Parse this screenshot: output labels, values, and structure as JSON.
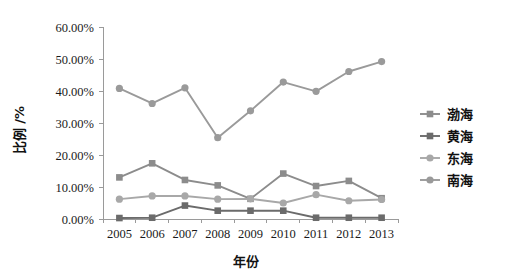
{
  "chart_data": {
    "type": "line",
    "title": "",
    "xlabel": "年份",
    "ylabel": "比例 /%",
    "categories": [
      "2005",
      "2006",
      "2007",
      "2008",
      "2009",
      "2010",
      "2011",
      "2012",
      "2013"
    ],
    "ylim": [
      0,
      60
    ],
    "ytick_labels": [
      "0.00%",
      "10.00%",
      "20.00%",
      "30.00%",
      "40.00%",
      "50.00%",
      "60.00%"
    ],
    "ytick_values": [
      0,
      10,
      20,
      30,
      40,
      50,
      60
    ],
    "grid": false,
    "legend_position": "right",
    "series": [
      {
        "name": "渤海",
        "marker": "square",
        "color": "#8c8c8c",
        "values": [
          13.0,
          17.4,
          12.2,
          10.5,
          6.3,
          14.2,
          10.3,
          11.9,
          6.5
        ]
      },
      {
        "name": "黄海",
        "marker": "square",
        "color": "#6b6b6b",
        "values": [
          0.3,
          0.4,
          4.2,
          2.6,
          2.6,
          2.6,
          0.4,
          0.4,
          0.4
        ]
      },
      {
        "name": "东海",
        "marker": "circle",
        "color": "#a8a8a8",
        "values": [
          6.2,
          7.2,
          7.2,
          6.2,
          6.3,
          5.0,
          7.6,
          5.7,
          6.1
        ]
      },
      {
        "name": "南海",
        "marker": "circle",
        "color": "#9a9a9a",
        "values": [
          40.8,
          36.1,
          41.0,
          25.4,
          33.8,
          42.8,
          39.9,
          46.1,
          49.2
        ]
      }
    ]
  },
  "legend": {
    "items": [
      {
        "label": "渤海",
        "marker": "square",
        "color": "#8c8c8c"
      },
      {
        "label": "黄海",
        "marker": "square",
        "color": "#6b6b6b"
      },
      {
        "label": "东海",
        "marker": "circle",
        "color": "#a8a8a8"
      },
      {
        "label": "南海",
        "marker": "circle",
        "color": "#9a9a9a"
      }
    ]
  }
}
